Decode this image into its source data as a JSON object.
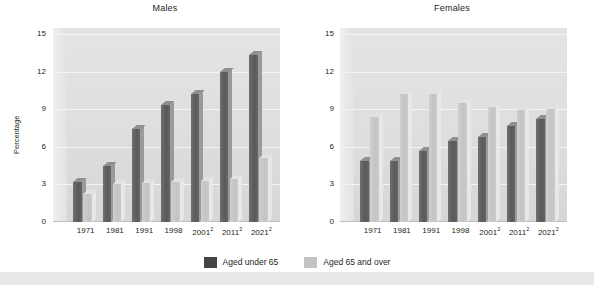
{
  "figure": {
    "ylabel": "Percentage",
    "legend": {
      "items": [
        {
          "label": "Aged under 65",
          "color": "#444444",
          "key": "under65"
        },
        {
          "label": "Aged 65 and over",
          "color": "#c3c3c3",
          "key": "over65"
        }
      ]
    }
  },
  "chart_data": [
    {
      "type": "bar",
      "title": "Males",
      "xlabel": "",
      "ylabel": "Percentage",
      "ylim": [
        0,
        15
      ],
      "yticks": [
        0,
        3,
        6,
        9,
        12,
        15
      ],
      "grid": true,
      "legend_position": "bottom",
      "categories": [
        "1971",
        "1981",
        "1991",
        "1998",
        "2001",
        "2011",
        "2021"
      ],
      "category_footnotes": [
        "",
        "",
        "",
        "",
        "2",
        "2",
        "2"
      ],
      "series": [
        {
          "name": "Aged under 65",
          "values": [
            3.2,
            4.5,
            7.4,
            9.3,
            10.2,
            12.0,
            13.3
          ]
        },
        {
          "name": "Aged 65 and over",
          "values": [
            2.2,
            3.0,
            3.1,
            3.2,
            3.3,
            3.4,
            5.1
          ]
        }
      ]
    },
    {
      "type": "bar",
      "title": "Females",
      "xlabel": "",
      "ylabel": "Percentage",
      "ylim": [
        0,
        15
      ],
      "yticks": [
        0,
        3,
        6,
        9,
        12,
        15
      ],
      "grid": true,
      "legend_position": "bottom",
      "categories": [
        "1971",
        "1981",
        "1991",
        "1998",
        "2001",
        "2011",
        "2021"
      ],
      "category_footnotes": [
        "",
        "",
        "",
        "",
        "2",
        "2",
        "2"
      ],
      "series": [
        {
          "name": "Aged under 65",
          "values": [
            4.9,
            4.9,
            5.7,
            6.5,
            6.8,
            7.7,
            8.2
          ]
        },
        {
          "name": "Aged 65 and over",
          "values": [
            8.4,
            10.2,
            10.2,
            9.5,
            9.2,
            8.9,
            9.0
          ]
        }
      ]
    }
  ]
}
